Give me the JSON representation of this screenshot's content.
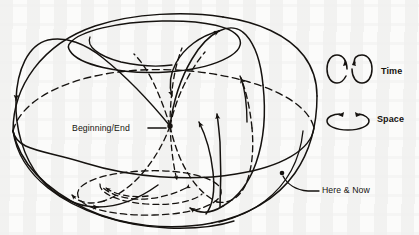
{
  "figure": {
    "background_color": "#fbfbfa",
    "ink_color": "#15120f"
  },
  "annotations": {
    "beginning_end": {
      "label": "Beginning/End",
      "leader": "horizontal dash from text to node",
      "marker": "dot"
    },
    "here_now": {
      "label": "Here & Now",
      "leader": "curved line from dot on surface",
      "marker": "dot"
    }
  },
  "legend": {
    "items": [
      {
        "label": "Time",
        "icon": "two-vertical-circular-arrows",
        "count": 2,
        "orientation": "vertical"
      },
      {
        "label": "Space",
        "icon": "horizontal-circular-arrow",
        "count": 1,
        "orientation": "horizontal"
      }
    ]
  },
  "geometry": {
    "outer_body": "sphere-torus outline",
    "equator": "ellipse, front solid / back dashed",
    "top_hole": "tilted ellipse near top",
    "bottom_hole": "dashed tilted ellipse near bottom",
    "trajectories": "closed helical world-lines, solid in front / dashed behind",
    "arrow_markers": 9
  }
}
